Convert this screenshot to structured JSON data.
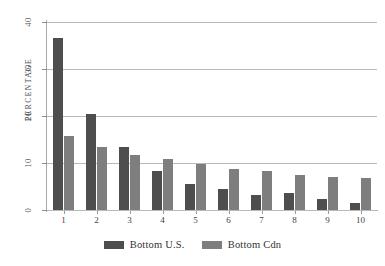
{
  "chart_data": {
    "type": "bar",
    "title": "",
    "xlabel": "",
    "ylabel": "PERCENTAGE",
    "ylim": [
      0,
      40
    ],
    "yticks": [
      0,
      10,
      20,
      30,
      40
    ],
    "grid": true,
    "legend_position": "bottom",
    "categories": [
      "1",
      "2",
      "3",
      "4",
      "5",
      "6",
      "7",
      "8",
      "9",
      "10"
    ],
    "series": [
      {
        "name": "Bottom U.S.",
        "color": "#4e4e4e",
        "values": [
          36.6,
          20.4,
          13.5,
          8.4,
          5.6,
          4.5,
          3.1,
          3.6,
          2.4,
          1.4
        ]
      },
      {
        "name": "Bottom Cdn",
        "color": "#7e7e7e",
        "values": [
          15.7,
          13.4,
          11.7,
          10.8,
          9.7,
          8.7,
          8.4,
          7.5,
          7.0,
          6.8
        ]
      }
    ]
  },
  "legend": {
    "items": [
      {
        "label": "Bottom U.S.",
        "color": "#4e4e4e"
      },
      {
        "label": "Bottom Cdn",
        "color": "#7e7e7e"
      }
    ]
  }
}
